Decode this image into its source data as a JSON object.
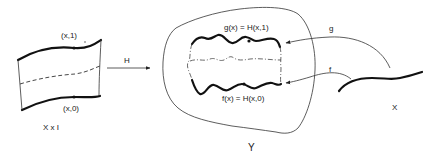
{
  "diagram": {
    "type": "homotopy-illustration",
    "domain_space": {
      "label": "X x I",
      "top_point_label": "(x,1)",
      "bottom_point_label": "(x,0)"
    },
    "map_H": {
      "label": "H"
    },
    "target_space": {
      "label": "Y",
      "top_curve_label": "g(x) = H(x,1)",
      "bottom_curve_label": "f(x) = H(x,0)"
    },
    "source_space": {
      "label": "X"
    },
    "map_g": {
      "label": "g"
    },
    "map_f": {
      "label": "f"
    },
    "colors": {
      "ink": "#111111",
      "background": "#ffffff"
    }
  }
}
